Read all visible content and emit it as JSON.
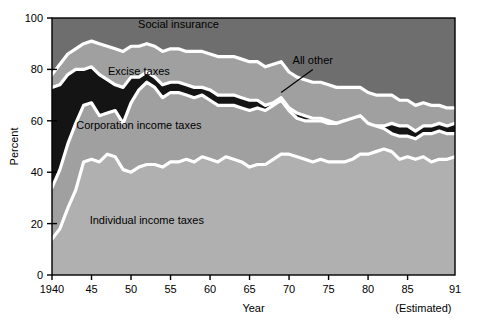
{
  "chart_data": {
    "type": "area",
    "title": "",
    "xlabel": "Year",
    "ylabel": "Percent",
    "xlim": [
      1940,
      1991
    ],
    "ylim": [
      0,
      100
    ],
    "grid": false,
    "legend_position": "inline-labels",
    "stacked": true,
    "x_ticks": [
      {
        "value": 1940,
        "label": "1940"
      },
      {
        "value": 1945,
        "label": "45"
      },
      {
        "value": 1950,
        "label": "50"
      },
      {
        "value": 1955,
        "label": "55"
      },
      {
        "value": 1960,
        "label": "60"
      },
      {
        "value": 1965,
        "label": "65"
      },
      {
        "value": 1970,
        "label": "70"
      },
      {
        "value": 1975,
        "label": "75"
      },
      {
        "value": 1980,
        "label": "80"
      },
      {
        "value": 1985,
        "label": "85"
      },
      {
        "value": 1991,
        "label": "91"
      }
    ],
    "y_ticks": [
      {
        "value": 0,
        "label": "0"
      },
      {
        "value": 20,
        "label": "20"
      },
      {
        "value": 40,
        "label": "40"
      },
      {
        "value": 60,
        "label": "60"
      },
      {
        "value": 80,
        "label": "80"
      },
      {
        "value": 100,
        "label": "100"
      }
    ],
    "annotations": [
      {
        "name": "estimated-note",
        "text": "(Estimated)",
        "x": 1987,
        "y": -12
      }
    ],
    "x": [
      1940,
      1941,
      1942,
      1943,
      1944,
      1945,
      1946,
      1947,
      1948,
      1949,
      1950,
      1951,
      1952,
      1953,
      1954,
      1955,
      1956,
      1957,
      1958,
      1959,
      1960,
      1961,
      1962,
      1963,
      1964,
      1965,
      1966,
      1967,
      1968,
      1969,
      1970,
      1971,
      1972,
      1973,
      1974,
      1975,
      1976,
      1977,
      1978,
      1979,
      1980,
      1981,
      1982,
      1983,
      1984,
      1985,
      1986,
      1987,
      1988,
      1989,
      1990,
      1991
    ],
    "series": [
      {
        "name": "Individual income taxes",
        "label": "Individual income taxes",
        "color": "#b0b0b0",
        "label_x": 1952,
        "label_y": 20,
        "values": [
          14,
          18,
          26,
          33,
          44,
          45,
          44,
          47,
          46,
          41,
          40,
          42,
          43,
          43,
          42,
          44,
          44,
          45,
          44,
          46,
          45,
          44,
          46,
          45,
          44,
          42,
          43,
          43,
          45,
          47,
          47,
          46,
          45,
          44,
          45,
          44,
          44,
          44,
          45,
          47,
          47,
          48,
          49,
          48,
          45,
          46,
          45,
          46,
          44,
          45,
          45,
          46
        ]
      },
      {
        "name": "Corporation income taxes",
        "label": "Corporation income taxes",
        "color": "#a0a0a0",
        "label_x": 1951,
        "label_y": 57,
        "values": [
          34,
          41,
          51,
          59,
          66,
          67,
          62,
          63,
          64,
          59,
          67,
          72,
          75,
          73,
          69,
          71,
          71,
          70,
          69,
          70,
          68,
          66,
          66,
          66,
          65,
          64,
          65,
          64,
          66,
          68,
          64,
          61,
          60,
          60,
          60,
          59,
          59,
          60,
          61,
          62,
          59,
          58,
          57,
          55,
          54,
          54,
          53,
          55,
          55,
          56,
          55,
          55
        ]
      },
      {
        "name": "Excise taxes",
        "label": "Excise taxes",
        "color": "#141414",
        "label_x": 1951,
        "label_y": 78,
        "values": [
          73,
          74,
          78,
          80,
          80,
          81,
          78,
          76,
          74,
          73,
          77,
          77,
          79,
          77,
          74,
          75,
          75,
          74,
          73,
          73,
          72,
          70,
          70,
          70,
          69,
          68,
          68,
          66,
          67,
          69,
          65,
          63,
          62,
          61,
          61,
          60,
          59,
          60,
          60,
          61,
          58,
          58,
          58,
          59,
          58,
          58,
          56,
          58,
          58,
          59,
          58,
          59
        ]
      },
      {
        "name": "All other",
        "label": "All other",
        "color": "#a0a0a0",
        "label_x": 1973,
        "label_y": 82,
        "leader": {
          "x1": 1973,
          "y1": 80,
          "x2": 1969,
          "y2": 71
        },
        "values": [
          78,
          82,
          86,
          88,
          90,
          91,
          90,
          89,
          88,
          87,
          89,
          89,
          90,
          89,
          87,
          88,
          88,
          87,
          87,
          87,
          86,
          85,
          85,
          85,
          84,
          83,
          83,
          81,
          82,
          83,
          79,
          77,
          76,
          75,
          75,
          74,
          73,
          73,
          73,
          73,
          71,
          70,
          70,
          70,
          68,
          68,
          66,
          67,
          66,
          66,
          65,
          65
        ]
      },
      {
        "name": "Social insurance",
        "label": "Social insurance",
        "color": "#6e6e6e",
        "label_x": 1956,
        "label_y": 96,
        "values": [
          100,
          100,
          100,
          100,
          100,
          100,
          100,
          100,
          100,
          100,
          100,
          100,
          100,
          100,
          100,
          100,
          100,
          100,
          100,
          100,
          100,
          100,
          100,
          100,
          100,
          100,
          100,
          100,
          100,
          100,
          100,
          100,
          100,
          100,
          100,
          100,
          100,
          100,
          100,
          100,
          100,
          100,
          100,
          100,
          100,
          100,
          100,
          100,
          100,
          100,
          100,
          100
        ]
      }
    ]
  },
  "style": {
    "plot_background": "#6e6e6e",
    "separator_color": "#ffffff",
    "axis_color": "#000000",
    "page_background": "#ffffff"
  }
}
